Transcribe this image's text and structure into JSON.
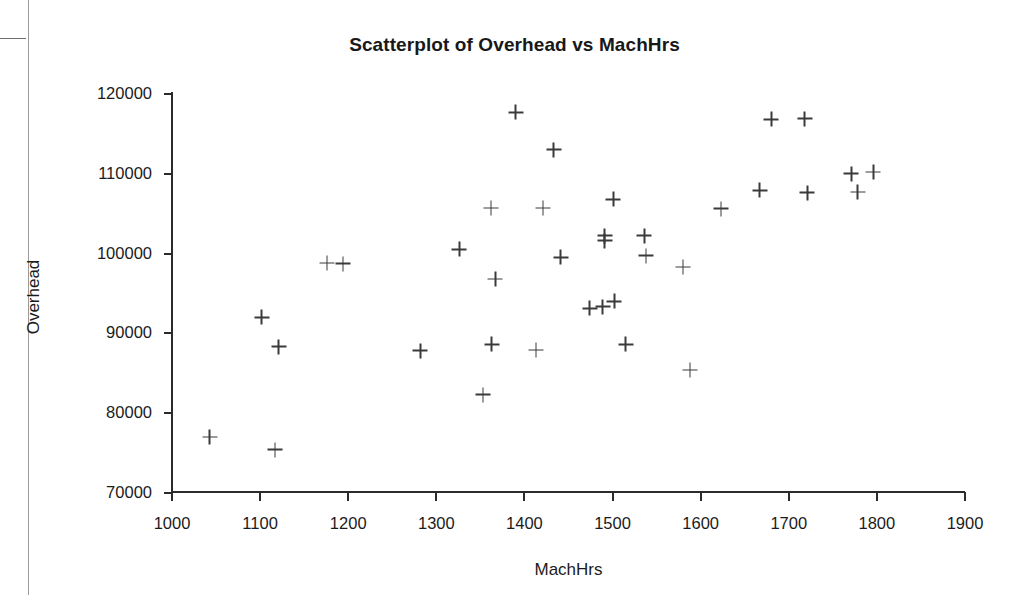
{
  "chart_data": {
    "type": "scatter",
    "title": "Scatterplot of Overhead vs MachHrs",
    "xlabel": "MachHrs",
    "ylabel": "Overhead",
    "xlim": [
      1000,
      1900
    ],
    "ylim": [
      70000,
      120000
    ],
    "xticks": [
      1000,
      1100,
      1200,
      1300,
      1400,
      1500,
      1600,
      1700,
      1800,
      1900
    ],
    "yticks": [
      70000,
      80000,
      90000,
      100000,
      110000,
      120000
    ],
    "grid": false,
    "legend": false,
    "marker": "plus",
    "marker_color": "#3a3a3a",
    "series": [
      {
        "name": "Overhead vs MachHrs",
        "points": [
          {
            "x": 1043,
            "y": 76900
          },
          {
            "x": 1102,
            "y": 91900
          },
          {
            "x": 1121,
            "y": 88200
          },
          {
            "x": 1117,
            "y": 75300
          },
          {
            "x": 1176,
            "y": 98700
          },
          {
            "x": 1194,
            "y": 98600
          },
          {
            "x": 1282,
            "y": 87700
          },
          {
            "x": 1326,
            "y": 100400
          },
          {
            "x": 1353,
            "y": 82200
          },
          {
            "x": 1367,
            "y": 96700
          },
          {
            "x": 1363,
            "y": 88500
          },
          {
            "x": 1362,
            "y": 105600
          },
          {
            "x": 1390,
            "y": 117600
          },
          {
            "x": 1413,
            "y": 87800
          },
          {
            "x": 1421,
            "y": 105600
          },
          {
            "x": 1433,
            "y": 112900
          },
          {
            "x": 1441,
            "y": 99400
          },
          {
            "x": 1474,
            "y": 93000
          },
          {
            "x": 1489,
            "y": 93200
          },
          {
            "x": 1502,
            "y": 93900
          },
          {
            "x": 1491,
            "y": 102100
          },
          {
            "x": 1491,
            "y": 101500
          },
          {
            "x": 1501,
            "y": 106700
          },
          {
            "x": 1515,
            "y": 88500
          },
          {
            "x": 1536,
            "y": 102100
          },
          {
            "x": 1538,
            "y": 99600
          },
          {
            "x": 1580,
            "y": 98200
          },
          {
            "x": 1588,
            "y": 85300
          },
          {
            "x": 1623,
            "y": 105500
          },
          {
            "x": 1667,
            "y": 107800
          },
          {
            "x": 1680,
            "y": 116700
          },
          {
            "x": 1718,
            "y": 116800
          },
          {
            "x": 1721,
            "y": 107500
          },
          {
            "x": 1771,
            "y": 109900
          },
          {
            "x": 1778,
            "y": 107600
          },
          {
            "x": 1796,
            "y": 110100
          }
        ]
      }
    ]
  }
}
